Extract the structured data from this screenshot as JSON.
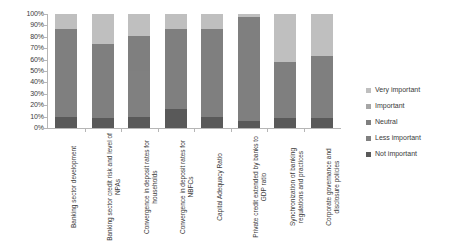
{
  "chart_data": {
    "type": "bar",
    "title": "",
    "xlabel": "",
    "ylabel": "",
    "ylim": [
      0,
      100
    ],
    "grid": false,
    "stacked": true,
    "stack_mode": "percent",
    "legend_position": "right",
    "ytick_labels": [
      "100%",
      "90%",
      "80%",
      "70%",
      "60%",
      "50%",
      "40%",
      "30%",
      "20%",
      "10%",
      "0%"
    ],
    "ytick_values": [
      100,
      90,
      80,
      70,
      60,
      50,
      40,
      30,
      20,
      10,
      0
    ],
    "categories": [
      "Banking sector development",
      "Banking sector credit risk and level of NPAs",
      "Convergence in deposit rates for households",
      "Convergence in deposit rates for NBFCs",
      "Capital Adequacy Ratio",
      "Private credit extended by banks to GDP ratio",
      "Synchronization of banking regulations and practices",
      "Corporate governance and disclosure policies"
    ],
    "series": [
      {
        "name": "Not important",
        "color": "#595959",
        "values": [
          10,
          9,
          10,
          17,
          10,
          6,
          9,
          9
        ]
      },
      {
        "name": "Less important",
        "color": "#808080",
        "values": [
          0,
          0,
          40,
          0,
          0,
          0,
          0,
          0
        ]
      },
      {
        "name": "Neutral",
        "color": "#7f7f7f",
        "values": [
          77,
          65,
          31,
          70,
          77,
          91,
          49,
          54
        ]
      },
      {
        "name": "Important",
        "color": "#a6a6a6",
        "values": [
          0,
          0,
          0,
          0,
          0,
          0,
          0,
          0
        ]
      },
      {
        "name": "Very important",
        "color": "#bfbfbf",
        "values": [
          13,
          26,
          19,
          13,
          13,
          3,
          42,
          37
        ]
      }
    ],
    "legend_entries": [
      {
        "label": "Very important",
        "color": "#bfbfbf"
      },
      {
        "label": "Important",
        "color": "#a6a6a6"
      },
      {
        "label": "Neutral",
        "color": "#7f7f7f"
      },
      {
        "label": "Less important",
        "color": "#808080"
      },
      {
        "label": "Not important",
        "color": "#595959"
      }
    ]
  }
}
